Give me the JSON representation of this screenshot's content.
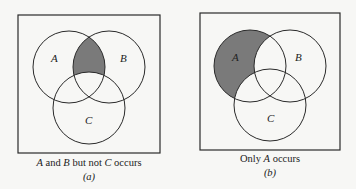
{
  "colors": {
    "shade": "#7a7a7a",
    "stroke": "#2a2a2a",
    "background": "#f7f7f5"
  },
  "panels": [
    {
      "id": "a",
      "circle_labels": {
        "A": "A",
        "B": "B",
        "C": "C"
      },
      "caption": {
        "set1": "A",
        "and": " and ",
        "set2": "B",
        "butnot": " but not ",
        "set3": "C",
        "occurs": " occurs"
      },
      "sublabel": "(a)",
      "shaded_region": "A ∩ B ∩ not C"
    },
    {
      "id": "b",
      "circle_labels": {
        "A": "A",
        "B": "B",
        "C": "C"
      },
      "caption": {
        "only": "Only ",
        "set1": "A",
        "occurs": " occurs"
      },
      "sublabel": "(b)",
      "shaded_region": "A only"
    }
  ]
}
